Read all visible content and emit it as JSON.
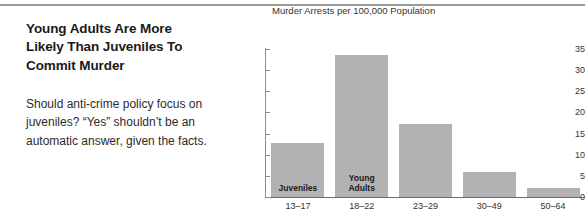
{
  "article": {
    "headline": "Young Adults Are More Likely Than Juveniles To Commit Murder",
    "deck": "Should anti-crime policy focus on juveniles? “Yes” shouldn’t be an automatic answer, given the facts."
  },
  "colors": {
    "bar_fill": "#b2b2b2",
    "axis": "#8c8c8c",
    "text": "#333333",
    "headline": "#1a1a1a",
    "rule": "#9a9a9a"
  },
  "chart_data": {
    "type": "bar",
    "title": "Murder Arrests per 100,000 Population",
    "xlabel": "",
    "ylabel": "",
    "ylim": [
      0,
      35
    ],
    "yticks": [
      0,
      5,
      10,
      15,
      20,
      25,
      30,
      35
    ],
    "grid": false,
    "legend": "none",
    "categories": [
      "13–17",
      "18–22",
      "23–29",
      "30–49",
      "50–64"
    ],
    "values": [
      12.8,
      33.7,
      17.2,
      5.9,
      2.1
    ],
    "annotations": [
      {
        "category": "13–17",
        "label": "Juveniles",
        "position": "inside-bottom"
      },
      {
        "category": "18–22",
        "label": "Young\nAdults",
        "position": "inside-bottom"
      }
    ]
  }
}
